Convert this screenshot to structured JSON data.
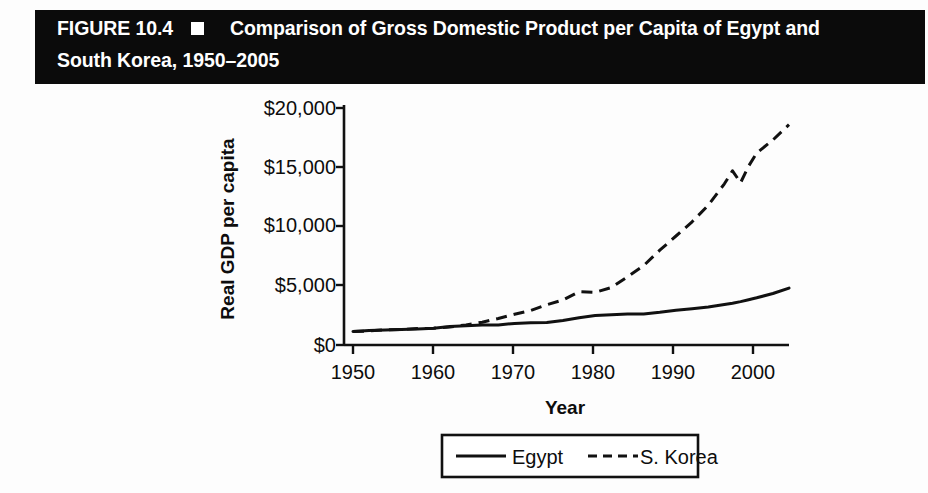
{
  "figure": {
    "number_label": "FIGURE 10.4",
    "marker": "black-square-bullet",
    "title_line1": "Comparison of Gross Domestic Product per Capita of Egypt and",
    "title_line2": "South Korea, 1950–2005",
    "banner_color": "#0b0b0b",
    "banner_text_color": "#ffffff"
  },
  "chart_data": {
    "type": "line",
    "title": "Comparison of Gross Domestic Product per Capita of Egypt and South Korea, 1950–2005",
    "xlabel": "Year",
    "ylabel": "Real GDP per capita",
    "xlim": [
      1950,
      2005
    ],
    "ylim": [
      0,
      20000
    ],
    "grid": false,
    "legend_position": "bottom-center",
    "xticks": [
      1950,
      1960,
      1970,
      1980,
      1990,
      2000
    ],
    "xticklabels": [
      "1950",
      "1960",
      "1970",
      "1980",
      "1990",
      "2000"
    ],
    "yticks": [
      0,
      5000,
      10000,
      15000,
      20000
    ],
    "yticklabels": [
      "$0",
      "$5,000",
      "$10,000",
      "$15,000",
      "$20,000"
    ],
    "x": [
      1950,
      1952,
      1954,
      1956,
      1958,
      1960,
      1962,
      1964,
      1966,
      1968,
      1970,
      1972,
      1974,
      1976,
      1978,
      1980,
      1982,
      1984,
      1986,
      1988,
      1990,
      1992,
      1994,
      1996,
      1997,
      1998,
      1999,
      2000,
      2002,
      2004
    ],
    "series": [
      {
        "name": "Egypt",
        "style": "solid",
        "color": "#111111",
        "values": [
          1150,
          1230,
          1260,
          1300,
          1350,
          1420,
          1560,
          1620,
          1680,
          1700,
          1820,
          1880,
          1900,
          2080,
          2300,
          2480,
          2560,
          2620,
          2620,
          2760,
          2940,
          3060,
          3200,
          3420,
          3530,
          3660,
          3820,
          3980,
          4350,
          4800
        ]
      },
      {
        "name": "S. Korea",
        "style": "dashed",
        "color": "#111111",
        "values": [
          1150,
          1180,
          1280,
          1320,
          1380,
          1420,
          1520,
          1700,
          1920,
          2240,
          2600,
          2900,
          3400,
          3800,
          4500,
          4450,
          4850,
          5750,
          6700,
          8000,
          9200,
          10400,
          11800,
          13600,
          14700,
          13700,
          15100,
          16200,
          17300,
          18600
        ]
      }
    ],
    "legend_entries": [
      {
        "label": "Egypt",
        "style": "solid"
      },
      {
        "label": "S. Korea",
        "style": "dashed"
      }
    ]
  }
}
